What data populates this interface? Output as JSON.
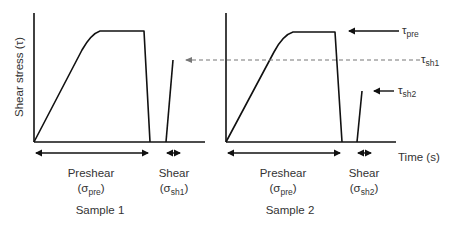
{
  "diagram": {
    "y_axis_label": "Shear stress (τ)",
    "x_axis_label": "Time (s)",
    "samples": [
      {
        "name": "Sample 1",
        "preshear_label": "Preshear",
        "preshear_sigma": "(σ",
        "preshear_sub": "pre",
        "preshear_close": ")",
        "shear_label": "Shear",
        "shear_sigma": "(σ",
        "shear_sub": "sh1",
        "shear_close": ")"
      },
      {
        "name": "Sample 2",
        "preshear_label": "Preshear",
        "preshear_sigma": "(σ",
        "preshear_sub": "pre",
        "preshear_close": ")",
        "shear_label": "Shear",
        "shear_sigma": "(σ",
        "shear_sub": "sh2",
        "shear_close": ")"
      }
    ],
    "annotations": {
      "tau_pre": {
        "symbol": "τ",
        "sub": "pre"
      },
      "tau_sh1": {
        "symbol": "τ",
        "sub": "sh1"
      },
      "tau_sh2": {
        "symbol": "τ",
        "sub": "sh2"
      }
    },
    "colors": {
      "line": "#111111",
      "dashed": "#777777",
      "text": "#333333"
    }
  }
}
